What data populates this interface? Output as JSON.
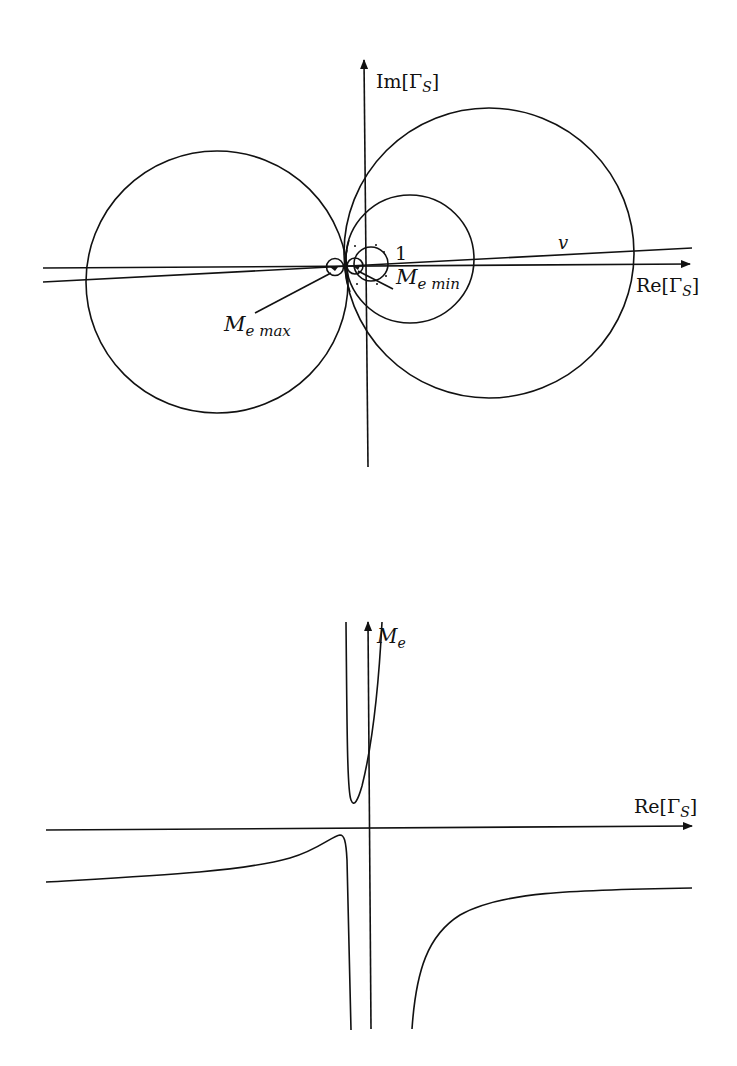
{
  "colors": {
    "stroke": "#111111",
    "background": "#ffffff"
  },
  "top_plot": {
    "y_axis_label": {
      "prefix": "Im[",
      "greek": "Γ",
      "sub": "S",
      "suffix": "]"
    },
    "x_axis_label": {
      "prefix": "Re[",
      "greek": "Γ",
      "sub": "S",
      "suffix": "]"
    },
    "unit_circle_label": "1",
    "line_label": "v",
    "max_label": {
      "main": "M",
      "sub": "e max"
    },
    "min_label": {
      "main": "M",
      "sub": "e min"
    }
  },
  "bottom_plot": {
    "y_axis_label": {
      "main": "M",
      "sub": "e"
    },
    "x_axis_label": {
      "prefix": "Re[",
      "greek": "Γ",
      "sub": "S",
      "suffix": "]"
    }
  }
}
